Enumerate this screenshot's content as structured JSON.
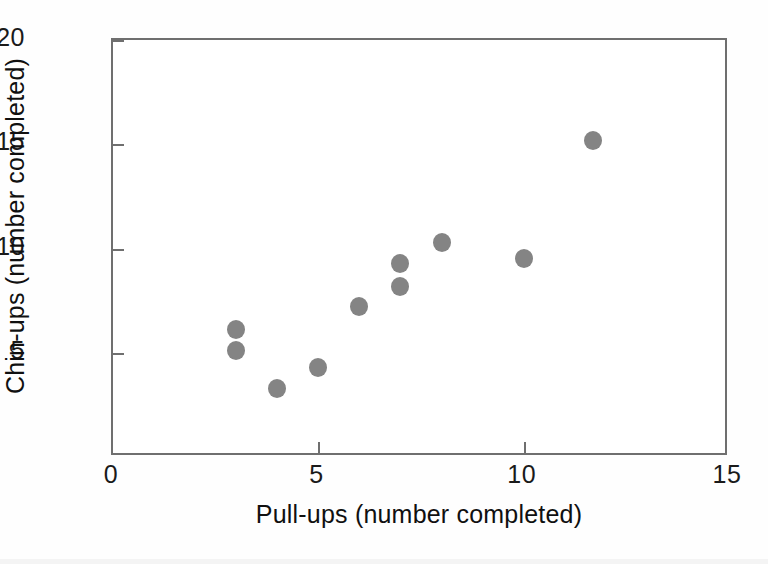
{
  "chart_data": {
    "type": "scatter",
    "title": "",
    "xlabel": "Pull-ups (number completed)",
    "ylabel": "Chin-ups (number completed)",
    "xlim": [
      0,
      15
    ],
    "ylim": [
      0,
      20
    ],
    "xticks": [
      "0",
      "5",
      "10",
      "15"
    ],
    "xtick_values": [
      0,
      5,
      10,
      15
    ],
    "yticks": [
      "5",
      "10",
      "15",
      "20"
    ],
    "ytick_values": [
      5,
      10,
      15,
      20
    ],
    "grid": false,
    "legend": null,
    "marker_color": "#848484",
    "axis_color": "#6f6f6f",
    "points": [
      {
        "x": 3,
        "y": 6.1,
        "label": "3, 6.1"
      },
      {
        "x": 3,
        "y": 5.1,
        "label": "3, 5.1"
      },
      {
        "x": 4,
        "y": 3.3,
        "label": "4, 3.3"
      },
      {
        "x": 5,
        "y": 4.3,
        "label": "5, 4.3"
      },
      {
        "x": 6,
        "y": 7.2,
        "label": "6, 7.2"
      },
      {
        "x": 7,
        "y": 9.3,
        "label": "7, 9.3"
      },
      {
        "x": 7,
        "y": 8.2,
        "label": "7, 8.2"
      },
      {
        "x": 8,
        "y": 10.3,
        "label": "8, 10.3"
      },
      {
        "x": 10,
        "y": 9.5,
        "label": "10, 9.5"
      },
      {
        "x": 11.7,
        "y": 15.2,
        "label": "11.7, 15.2"
      }
    ]
  }
}
